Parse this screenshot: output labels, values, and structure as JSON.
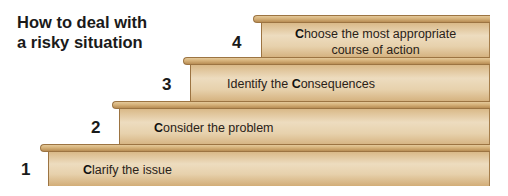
{
  "title": {
    "line1": "How to deal with",
    "line2": "a risky situation"
  },
  "steps": [
    {
      "number": "1",
      "initial": "C",
      "rest": "larify the issue",
      "rest_line2": ""
    },
    {
      "number": "2",
      "initial": "C",
      "rest": "onsider the problem",
      "rest_line2": ""
    },
    {
      "number": "3",
      "prefix": "Identify the ",
      "initial": "C",
      "rest": "onsequences"
    },
    {
      "number": "4",
      "initial": "C",
      "rest": "hoose the most appropriate",
      "rest_line2": "course of action"
    }
  ],
  "colors": {
    "wood_light": "#eddcbf",
    "wood_mid": "#d9b988",
    "wood_dark": "#9c7442"
  }
}
